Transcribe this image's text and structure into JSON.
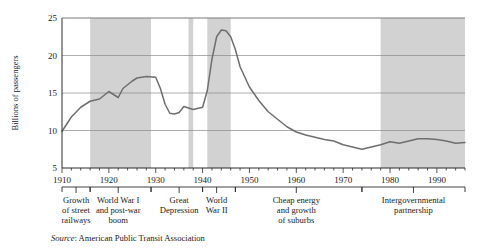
{
  "figure": {
    "source_prefix": "Source",
    "source_text": ": American Public Transit Association"
  },
  "chart_data": {
    "type": "line",
    "title": "",
    "xlabel": "",
    "ylabel": "Billions of passengers",
    "xlim": [
      1910,
      1996
    ],
    "ylim": [
      5,
      25
    ],
    "yticks": [
      5,
      10,
      15,
      20,
      25
    ],
    "xticks": [
      1910,
      1920,
      1930,
      1940,
      1950,
      1960,
      1970,
      1980,
      1990
    ],
    "xtick_labels": [
      "1910",
      "1920",
      "1930",
      "1940",
      "1950",
      "1960",
      "1970",
      "1980",
      "1990"
    ],
    "ytick_labels": [
      "5",
      "10",
      "15",
      "20",
      "25"
    ],
    "grid": true,
    "legend": "none",
    "minor_tick_interval": 2,
    "series": [
      {
        "name": "Transit ridership",
        "x": [
          1910,
          1912,
          1914,
          1916,
          1918,
          1920,
          1922,
          1923,
          1924,
          1925,
          1926,
          1928,
          1930,
          1931,
          1932,
          1933,
          1934,
          1935,
          1936,
          1938,
          1940,
          1941,
          1942,
          1943,
          1944,
          1945,
          1946,
          1947,
          1948,
          1950,
          1952,
          1954,
          1956,
          1958,
          1960,
          1962,
          1964,
          1966,
          1968,
          1970,
          1972,
          1974,
          1976,
          1978,
          1980,
          1982,
          1984,
          1986,
          1988,
          1990,
          1992,
          1994,
          1996
        ],
        "y": [
          9.9,
          11.8,
          13.1,
          13.9,
          14.2,
          15.2,
          14.4,
          15.6,
          16.1,
          16.6,
          17.0,
          17.2,
          17.1,
          15.6,
          13.5,
          12.3,
          12.2,
          12.4,
          13.2,
          12.8,
          13.1,
          15.3,
          19.5,
          22.5,
          23.4,
          23.3,
          22.5,
          20.8,
          18.5,
          15.8,
          14.0,
          12.5,
          11.5,
          10.5,
          9.8,
          9.4,
          9.1,
          8.8,
          8.6,
          8.1,
          7.8,
          7.5,
          7.8,
          8.1,
          8.5,
          8.3,
          8.6,
          8.9,
          8.9,
          8.8,
          8.6,
          8.3,
          8.4
        ]
      }
    ],
    "shaded_bands": [
      {
        "label": "World War I and post-war boom",
        "start": 1916,
        "end": 1929
      },
      {
        "label": "Great Depression",
        "start": 1937,
        "end": 1938
      },
      {
        "label": "World War II",
        "start": 1941,
        "end": 1946
      },
      {
        "label": "Intergovernmental partnership",
        "start": 1978,
        "end": 1996
      }
    ],
    "era_annotations": [
      {
        "lines": [
          "Growth",
          "of street",
          "railways"
        ],
        "start": 1910,
        "end": 1916,
        "center": 1913
      },
      {
        "lines": [
          "World War I",
          "and post-war",
          "boom"
        ],
        "start": 1916,
        "end": 1929,
        "center": 1922
      },
      {
        "lines": [
          "Great",
          "Depression"
        ],
        "start": 1929,
        "end": 1940,
        "center": 1935
      },
      {
        "lines": [
          "World",
          "War II"
        ],
        "start": 1940,
        "end": 1947,
        "center": 1943
      },
      {
        "lines": [
          "Cheap energy",
          "and growth",
          "of suburbs"
        ],
        "start": 1947,
        "end": 1974,
        "center": 1960
      },
      {
        "lines": [
          "Intergovernmental",
          "partnership"
        ],
        "start": 1974,
        "end": 1996,
        "center": 1985
      }
    ],
    "colors": {
      "band": "#d2d2d2",
      "line": "#6e6e6e",
      "grid": "#8a8a8a",
      "axis": "#2b2b2b",
      "background": "#ffffff"
    }
  }
}
